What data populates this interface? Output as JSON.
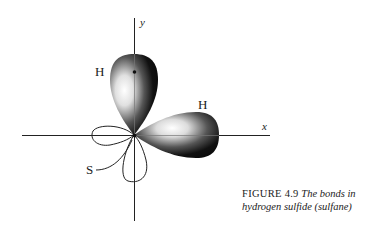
{
  "diagram": {
    "axes": {
      "x_label": "x",
      "y_label": "y"
    },
    "atoms": {
      "h_top": "H",
      "h_right": "H",
      "s": "S"
    },
    "colors": {
      "lobe_dark": "#111111",
      "lobe_highlight": "#f4f4f4",
      "line": "#222222"
    }
  },
  "caption": {
    "figure_label": "FIGURE 4.9",
    "text_line1": "The bonds in",
    "text_line2": "hydrogen sulfide (sulfane)"
  }
}
